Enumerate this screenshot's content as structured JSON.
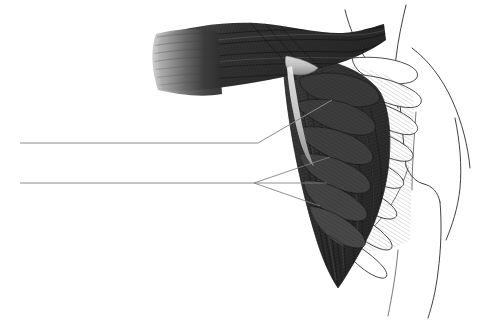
{
  "figure": {
    "type": "line-and-tone anatomical drawing",
    "view": "anterolateral right chest and shoulder",
    "background_color": "#ffffff",
    "canvas": {
      "width": 495,
      "height": 330
    }
  },
  "palette": {
    "paper": "#ffffff",
    "muscle_dark": "#2f2f2f",
    "muscle_mid": "#4a4a4a",
    "muscle_light": "#8d8d8d",
    "muscle_fade": "#b9b9b9",
    "tendon_highlight": "#dcdcdc",
    "outline": "#2b2b2b",
    "outline_soft": "#555555",
    "leader_line": "#8a8a8a"
  },
  "structures": [
    {
      "id": "pectoralis-major-clavicular",
      "label": "pectoralis major, upper fiber band",
      "tone": "muscle_dark",
      "description": "broad twisted band of striated fibers sweeping from upper left toward the humeral insertion"
    },
    {
      "id": "pectoralis-major-cut-fibers",
      "label": "cut fiber fan, lateral end",
      "tone": "muscle_fade",
      "description": "pale feathered fiber ends fading to the left margin of the muscle belly"
    },
    {
      "id": "humeral-insertion-twist",
      "label": "humeral insertion twist",
      "tone": "tendon_highlight",
      "description": "pale wedge where the fibers fold and twist at the insertion"
    },
    {
      "id": "pectoralis-major-sternocostal",
      "label": "pectoralis major, sternocostal fan",
      "tone": "muscle_dark",
      "description": "large triangular dark mass fanning downward and tapering to an inferior point"
    },
    {
      "id": "central-aponeurosis",
      "label": "central tendinous band",
      "tone": "tendon_highlight",
      "description": "pale curved aponeurotic stripe running down through the muscle belly"
    },
    {
      "id": "serratus-anterior-digitations",
      "label": "serratus anterior digitations",
      "tone": "muscle_mid",
      "description": "interdigitating slips radiating toward the rib cage"
    },
    {
      "id": "rib-outlines",
      "label": "rib and costal outlines",
      "tone": "outline",
      "description": "thin finger-like outlined ribs projecting to the right toward the torso"
    },
    {
      "id": "body-contour",
      "label": "neck, shoulder and trunk contour",
      "tone": "outline",
      "description": "thin unfilled outline of the neck, deltoid shoulder, axilla and flank"
    }
  ],
  "leader_lines": [
    {
      "id": "leader-upper",
      "label_text": "",
      "start": {
        "x": 20,
        "y": 143
      },
      "horizontal_end": {
        "x": 258,
        "y": 143
      },
      "pointer_end": {
        "x": 332,
        "y": 100
      },
      "branch_count": 1,
      "points_to": "central-aponeurosis"
    },
    {
      "id": "leader-lower",
      "label_text": "",
      "start": {
        "x": 20,
        "y": 183
      },
      "horizontal_end": {
        "x": 254,
        "y": 183
      },
      "branch_count": 3,
      "branch_ends": [
        {
          "x": 330,
          "y": 157
        },
        {
          "x": 327,
          "y": 183
        },
        {
          "x": 320,
          "y": 206
        }
      ],
      "points_to": "serratus-anterior-digitations"
    }
  ],
  "annotations": {
    "has_text_labels": false,
    "note": "Leader lines are drawn but carry no printed caption text in this image."
  }
}
